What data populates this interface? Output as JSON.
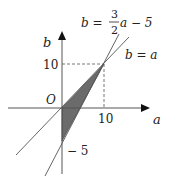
{
  "diagram": {
    "axes": {
      "x_label": "a",
      "y_label": "b",
      "origin_label": "O"
    },
    "ticks": {
      "x_10": "10",
      "y_10": "10",
      "y_neg5": "− 5"
    },
    "lines": {
      "line1_lhs": "b =",
      "line1_frac_num": "3",
      "line1_frac_den": "2",
      "line1_rhs": "a − 5",
      "line2": "b = a"
    },
    "shaded_region": {
      "vertices": [
        [
          0,
          0
        ],
        [
          10,
          10
        ],
        [
          0,
          -5
        ]
      ],
      "color": "#666666"
    }
  }
}
